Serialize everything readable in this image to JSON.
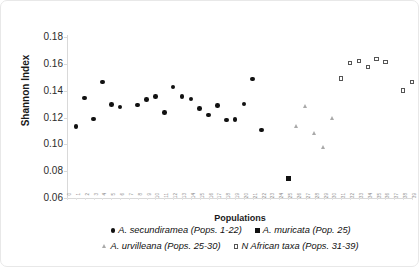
{
  "chart_data": {
    "type": "scatter",
    "title": "",
    "xlabel": "Populations",
    "ylabel": "Shannon Index",
    "ylim": [
      0.06,
      0.18
    ],
    "xlim": [
      0,
      39
    ],
    "grid": false,
    "legend_position": "bottom",
    "y_ticks": [
      "0.18",
      "0.16",
      "0.14",
      "0.12",
      "0.10",
      "0.08",
      "0.06"
    ],
    "y_tick_values": [
      0.18,
      0.16,
      0.14,
      0.12,
      0.1,
      0.08,
      0.06
    ],
    "x_ticks": [
      "0",
      "1",
      "2",
      "3",
      "4",
      "5",
      "6",
      "7",
      "8",
      "9",
      "10",
      "11",
      "12",
      "13",
      "14",
      "15",
      "16",
      "17",
      "18",
      "19",
      "20",
      "21",
      "22",
      "23",
      "24",
      "25",
      "26",
      "27",
      "28",
      "29",
      "30",
      "31",
      "32",
      "33",
      "34",
      "35",
      "36",
      "37",
      "38",
      "39"
    ],
    "series": [
      {
        "name": "A. secundiramea (Pops. 1-22)",
        "marker": "circle-filled",
        "color": "#111111",
        "points": [
          {
            "x": 1,
            "y": 0.1135
          },
          {
            "x": 2,
            "y": 0.1345
          },
          {
            "x": 3,
            "y": 0.119
          },
          {
            "x": 4,
            "y": 0.1465
          },
          {
            "x": 5,
            "y": 0.1295
          },
          {
            "x": 6,
            "y": 0.1278
          },
          {
            "x": 8,
            "y": 0.1292
          },
          {
            "x": 9,
            "y": 0.1332
          },
          {
            "x": 10,
            "y": 0.1358
          },
          {
            "x": 11,
            "y": 0.1238
          },
          {
            "x": 12,
            "y": 0.1428
          },
          {
            "x": 13,
            "y": 0.1358
          },
          {
            "x": 14,
            "y": 0.1338
          },
          {
            "x": 15,
            "y": 0.1268
          },
          {
            "x": 16,
            "y": 0.122
          },
          {
            "x": 17,
            "y": 0.1288
          },
          {
            "x": 18,
            "y": 0.118
          },
          {
            "x": 19,
            "y": 0.1185
          },
          {
            "x": 20,
            "y": 0.1302
          },
          {
            "x": 21,
            "y": 0.1488
          },
          {
            "x": 22,
            "y": 0.1108
          }
        ]
      },
      {
        "name": "A. muricata (Pop. 25)",
        "marker": "square-filled",
        "color": "#111111",
        "points": [
          {
            "x": 25,
            "y": 0.0748
          }
        ]
      },
      {
        "name": "A. urvilleana (Pops. 25-30)",
        "marker": "triangle-up",
        "color": "#a9a9a9",
        "points": [
          {
            "x": 26,
            "y": 0.1135
          },
          {
            "x": 27,
            "y": 0.1282
          },
          {
            "x": 28,
            "y": 0.1082
          },
          {
            "x": 29,
            "y": 0.0972
          },
          {
            "x": 30,
            "y": 0.1188
          }
        ]
      },
      {
        "name": "N African taxa (Pops. 31-39)",
        "marker": "square-open",
        "color": "#555555",
        "points": [
          {
            "x": 31,
            "y": 0.1492
          },
          {
            "x": 32,
            "y": 0.1605
          },
          {
            "x": 33,
            "y": 0.162
          },
          {
            "x": 34,
            "y": 0.1578
          },
          {
            "x": 35,
            "y": 0.1638
          },
          {
            "x": 36,
            "y": 0.1612
          },
          {
            "x": 38,
            "y": 0.14
          },
          {
            "x": 39,
            "y": 0.1465
          }
        ]
      }
    ]
  },
  "legend": {
    "rows": [
      [
        {
          "marker": "circle-filled",
          "label": "A. secundiramea (Pops. 1-22)"
        },
        {
          "marker": "square-filled",
          "label": "A. muricata (Pop. 25)"
        }
      ],
      [
        {
          "marker": "triangle-up",
          "label": "A. urvilleana (Pops. 25-30)"
        },
        {
          "marker": "square-open",
          "label": "N African taxa (Pops. 31-39)"
        }
      ]
    ]
  }
}
